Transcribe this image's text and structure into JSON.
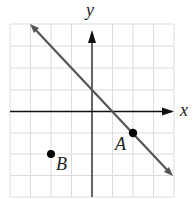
{
  "diagram": {
    "type": "coordinate-plane",
    "grid": {
      "xmin": -4,
      "xmax": 4,
      "ymin": -4,
      "ymax": 4,
      "step": 1
    },
    "axes": {
      "x_label": "x",
      "y_label": "y"
    },
    "line": {
      "equation": "y = -x + 1",
      "from": [
        -3,
        4
      ],
      "to": [
        4,
        -3
      ],
      "color": "#555555"
    },
    "points": [
      {
        "label": "A",
        "x": 2,
        "y": -1
      },
      {
        "label": "B",
        "x": -2,
        "y": -2
      }
    ],
    "colors": {
      "grid": "#dcdcdc",
      "axes": "#111111",
      "points": "#000000"
    }
  }
}
